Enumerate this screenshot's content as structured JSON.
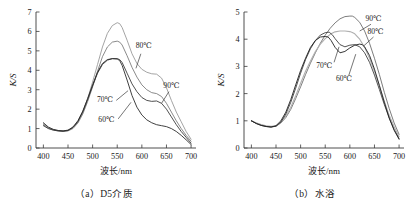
{
  "figure": {
    "panels": [
      {
        "id": "a",
        "caption": "（a）D5介质",
        "chart_data": {
          "type": "line",
          "title": "",
          "xlabel": "波长/nm",
          "ylabel": "K/S",
          "xlim": [
            385,
            710
          ],
          "ylim": [
            0,
            7
          ],
          "xticks": [
            400,
            450,
            500,
            550,
            600,
            650,
            700
          ],
          "yticks": [
            0,
            1,
            2,
            3,
            4,
            5,
            6,
            7
          ],
          "xtick_labels": [
            "400",
            "450",
            "500",
            "550",
            "600",
            "650",
            "700"
          ],
          "ytick_labels": [
            "0",
            "1",
            "2",
            "3",
            "4",
            "5",
            "6",
            "7"
          ],
          "grid": false,
          "legend": "inline-annotations",
          "series": [
            {
              "name": "80℃",
              "color": "#9a9a9a",
              "width": 0.9,
              "label_x": 604,
              "label_y": 5.15,
              "leader": [
                [
                  598,
                  4.85
                ],
                [
                  588,
                  4.1
                ]
              ],
              "x": [
                400,
                410,
                420,
                430,
                440,
                450,
                460,
                470,
                480,
                490,
                500,
                510,
                520,
                530,
                540,
                550,
                555,
                560,
                570,
                580,
                590,
                600,
                610,
                620,
                630,
                640,
                650,
                660,
                670,
                680,
                690,
                700
              ],
              "y": [
                1.25,
                1.05,
                0.95,
                0.9,
                0.88,
                0.9,
                1.05,
                1.35,
                1.85,
                2.55,
                3.4,
                4.3,
                5.2,
                5.9,
                6.3,
                6.45,
                6.4,
                6.2,
                5.55,
                4.85,
                4.35,
                4.05,
                3.9,
                3.82,
                3.8,
                3.6,
                3.1,
                2.45,
                1.85,
                1.35,
                0.85,
                0.45
              ]
            },
            {
              "name": "90℃",
              "color": "#7d7d7d",
              "width": 0.9,
              "label_x": 660,
              "label_y": 3.1,
              "leader": [
                [
                  655,
                  2.9
                ],
                [
                  640,
                  2.3
                ]
              ],
              "x": [
                400,
                410,
                420,
                430,
                440,
                450,
                460,
                470,
                480,
                490,
                500,
                510,
                520,
                530,
                540,
                550,
                555,
                560,
                570,
                580,
                590,
                600,
                610,
                620,
                630,
                640,
                650,
                660,
                670,
                680,
                690,
                700
              ],
              "y": [
                1.2,
                1.02,
                0.93,
                0.88,
                0.86,
                0.88,
                1.0,
                1.28,
                1.75,
                2.4,
                3.15,
                3.95,
                4.7,
                5.2,
                5.45,
                5.5,
                5.45,
                5.3,
                4.75,
                4.15,
                3.65,
                3.25,
                3.0,
                2.85,
                2.8,
                2.65,
                2.3,
                1.85,
                1.4,
                1.0,
                0.65,
                0.35
              ]
            },
            {
              "name": "70℃",
              "color": "#3c3c3c",
              "width": 0.9,
              "label_x": 525,
              "label_y": 2.35,
              "leader": [
                [
                  548,
                  2.45
                ],
                [
                  572,
                  2.95
                ]
              ],
              "x": [
                400,
                410,
                420,
                430,
                440,
                450,
                460,
                470,
                480,
                490,
                500,
                510,
                520,
                530,
                540,
                550,
                555,
                560,
                570,
                580,
                590,
                600,
                610,
                620,
                630,
                640,
                650,
                660,
                670,
                680,
                690,
                700
              ],
              "y": [
                1.15,
                1.0,
                0.92,
                0.88,
                0.86,
                0.9,
                1.05,
                1.35,
                1.85,
                2.5,
                3.2,
                3.85,
                4.3,
                4.52,
                4.6,
                4.6,
                4.55,
                4.4,
                3.85,
                3.3,
                2.9,
                2.6,
                2.45,
                2.4,
                2.42,
                2.3,
                2.0,
                1.6,
                1.2,
                0.85,
                0.55,
                0.25
              ]
            },
            {
              "name": "60℃",
              "color": "#2a2a2a",
              "width": 0.9,
              "label_x": 528,
              "label_y": 1.35,
              "leader": [
                [
                  552,
                  1.5
                ],
                [
                  578,
                  2.35
                ]
              ],
              "x": [
                400,
                410,
                420,
                430,
                440,
                450,
                460,
                470,
                480,
                490,
                500,
                510,
                520,
                530,
                540,
                550,
                555,
                560,
                570,
                580,
                590,
                600,
                610,
                620,
                630,
                640,
                650,
                660,
                670,
                680,
                690,
                700
              ],
              "y": [
                1.3,
                1.08,
                0.96,
                0.9,
                0.88,
                0.92,
                1.08,
                1.4,
                1.9,
                2.55,
                3.25,
                3.9,
                4.35,
                4.55,
                4.6,
                4.58,
                4.5,
                4.25,
                3.5,
                2.7,
                2.1,
                1.7,
                1.45,
                1.3,
                1.2,
                1.15,
                1.1,
                1.0,
                0.85,
                0.65,
                0.42,
                0.18
              ]
            }
          ]
        }
      },
      {
        "id": "b",
        "caption": "（b）水浴",
        "chart_data": {
          "type": "line",
          "title": "",
          "xlabel": "波长/nm",
          "ylabel": "K/S",
          "xlim": [
            385,
            710
          ],
          "ylim": [
            0,
            5
          ],
          "xticks": [
            400,
            450,
            500,
            550,
            600,
            650,
            700
          ],
          "yticks": [
            0,
            1,
            2,
            3,
            4,
            5
          ],
          "xtick_labels": [
            "400",
            "450",
            "500",
            "550",
            "600",
            "650",
            "700"
          ],
          "ytick_labels": [
            "0",
            "1",
            "2",
            "3",
            "4",
            "5"
          ],
          "grid": false,
          "legend": "inline-annotations",
          "series": [
            {
              "name": "90℃",
              "color": "#6e6e6e",
              "width": 0.9,
              "label_x": 648,
              "label_y": 4.68,
              "leader": [
                [
                  643,
                  4.55
                ],
                [
                  620,
                  4.3
                ]
              ],
              "x": [
                400,
                410,
                420,
                430,
                440,
                450,
                460,
                470,
                480,
                490,
                500,
                510,
                520,
                530,
                540,
                550,
                560,
                570,
                580,
                590,
                600,
                605,
                610,
                620,
                630,
                640,
                650,
                660,
                670,
                680,
                690,
                700
              ],
              "y": [
                1.0,
                0.92,
                0.85,
                0.8,
                0.78,
                0.8,
                0.92,
                1.12,
                1.42,
                1.82,
                2.25,
                2.7,
                3.12,
                3.5,
                3.85,
                4.15,
                4.4,
                4.6,
                4.75,
                4.83,
                4.85,
                4.85,
                4.8,
                4.62,
                4.3,
                3.85,
                3.3,
                2.7,
                2.05,
                1.45,
                0.92,
                0.5
              ]
            },
            {
              "name": "80℃",
              "color": "#b0b0b0",
              "width": 1.1,
              "label_x": 652,
              "label_y": 4.2,
              "leader": [
                [
                  648,
                  4.08
                ],
                [
                  628,
                  3.75
                ]
              ],
              "x": [
                400,
                410,
                420,
                430,
                440,
                450,
                460,
                470,
                480,
                490,
                500,
                510,
                520,
                530,
                540,
                550,
                560,
                570,
                580,
                590,
                600,
                605,
                610,
                620,
                630,
                640,
                650,
                660,
                670,
                680,
                690,
                700
              ],
              "y": [
                1.0,
                0.92,
                0.86,
                0.82,
                0.8,
                0.82,
                0.95,
                1.18,
                1.5,
                1.92,
                2.38,
                2.82,
                3.2,
                3.55,
                3.82,
                4.02,
                4.18,
                4.27,
                4.3,
                4.3,
                4.28,
                4.25,
                4.2,
                4.0,
                3.7,
                3.3,
                2.82,
                2.28,
                1.72,
                1.2,
                0.78,
                0.42
              ]
            },
            {
              "name": "70℃",
              "color": "#3f3f3f",
              "width": 0.9,
              "label_x": 548,
              "label_y": 2.95,
              "leader": [
                [
                  568,
                  3.15
                ],
                [
                  578,
                  3.72
                ]
              ],
              "x": [
                400,
                410,
                420,
                430,
                440,
                450,
                460,
                470,
                480,
                490,
                500,
                510,
                520,
                530,
                540,
                550,
                558,
                565,
                570,
                580,
                590,
                600,
                610,
                620,
                630,
                640,
                650,
                660,
                670,
                680,
                690,
                700
              ],
              "y": [
                1.0,
                0.9,
                0.83,
                0.79,
                0.77,
                0.8,
                0.95,
                1.25,
                1.68,
                2.2,
                2.75,
                3.25,
                3.65,
                3.95,
                4.15,
                4.24,
                4.26,
                4.15,
                4.02,
                3.8,
                3.72,
                3.78,
                3.8,
                3.72,
                3.5,
                3.15,
                2.68,
                2.15,
                1.6,
                1.1,
                0.68,
                0.35
              ]
            },
            {
              "name": "60℃",
              "color": "#1f1f1f",
              "width": 0.9,
              "label_x": 588,
              "label_y": 2.48,
              "leader": [
                [
                  598,
                  2.68
                ],
                [
                  612,
                  3.45
                ]
              ],
              "x": [
                400,
                410,
                420,
                430,
                440,
                450,
                460,
                470,
                480,
                490,
                500,
                510,
                520,
                530,
                540,
                550,
                556,
                562,
                570,
                580,
                590,
                600,
                610,
                620,
                625,
                630,
                640,
                650,
                660,
                670,
                680,
                690,
                700
              ],
              "y": [
                1.0,
                0.9,
                0.83,
                0.79,
                0.77,
                0.82,
                1.0,
                1.32,
                1.78,
                2.32,
                2.85,
                3.3,
                3.7,
                3.95,
                4.08,
                4.1,
                4.08,
                3.95,
                3.7,
                3.5,
                3.55,
                3.68,
                3.78,
                3.82,
                3.8,
                3.72,
                3.4,
                2.9,
                2.3,
                1.68,
                1.1,
                0.65,
                0.32
              ]
            }
          ]
        }
      }
    ]
  }
}
